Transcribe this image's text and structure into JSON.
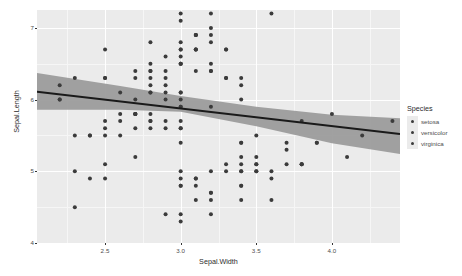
{
  "chart_data": {
    "type": "scatter",
    "title": "",
    "xlabel": "Sepal.Width",
    "ylabel": "Sepal.Length",
    "xlim": [
      2.05,
      4.45
    ],
    "ylim": [
      4.0,
      7.25
    ],
    "xticks": [
      2.5,
      3.0,
      3.5,
      4.0
    ],
    "xtick_labels": [
      "2.5",
      "3.0",
      "3.5",
      "4.0"
    ],
    "yticks": [
      4,
      5,
      6,
      7
    ],
    "ytick_labels": [
      "4",
      "5",
      "6",
      "7"
    ],
    "x_minor_ticks": [
      2.25,
      2.75,
      3.25,
      3.75,
      4.25
    ],
    "y_minor_ticks": [
      4.5,
      5.5,
      6.5
    ],
    "grid": true,
    "legend_position": "right",
    "point_color": "#3b3b3b",
    "panel_background": "#ebebeb",
    "gridline_color": "#ffffff",
    "smooth": {
      "method": "lm",
      "line_color": "#1a1a1a",
      "band_color": "#999999",
      "line": [
        {
          "x": 2.05,
          "y": 6.11
        },
        {
          "x": 4.45,
          "y": 5.52
        }
      ],
      "band_upper": [
        {
          "x": 2.05,
          "y": 6.37
        },
        {
          "x": 2.6,
          "y": 6.19
        },
        {
          "x": 3.0,
          "y": 6.05
        },
        {
          "x": 3.5,
          "y": 5.9
        },
        {
          "x": 4.0,
          "y": 5.79
        },
        {
          "x": 4.45,
          "y": 5.74
        }
      ],
      "band_lower": [
        {
          "x": 2.05,
          "y": 5.86
        },
        {
          "x": 2.6,
          "y": 5.86
        },
        {
          "x": 3.0,
          "y": 5.83
        },
        {
          "x": 3.5,
          "y": 5.63
        },
        {
          "x": 4.0,
          "y": 5.39
        },
        {
          "x": 4.45,
          "y": 5.24
        }
      ]
    },
    "legend": {
      "title": "Species",
      "entries": [
        {
          "label": "setosa",
          "color": "#3b3b3b"
        },
        {
          "label": "versicolor",
          "color": "#3b3b3b"
        },
        {
          "label": "virginica",
          "color": "#3b3b3b"
        }
      ]
    },
    "points": [
      {
        "x": 3.5,
        "y": 5.1
      },
      {
        "x": 3.0,
        "y": 4.9
      },
      {
        "x": 3.2,
        "y": 4.7
      },
      {
        "x": 3.1,
        "y": 4.6
      },
      {
        "x": 3.6,
        "y": 5.0
      },
      {
        "x": 3.9,
        "y": 5.4
      },
      {
        "x": 3.4,
        "y": 4.6
      },
      {
        "x": 3.4,
        "y": 5.0
      },
      {
        "x": 2.9,
        "y": 4.4
      },
      {
        "x": 3.1,
        "y": 4.9
      },
      {
        "x": 3.7,
        "y": 5.4
      },
      {
        "x": 3.4,
        "y": 4.8
      },
      {
        "x": 3.0,
        "y": 4.8
      },
      {
        "x": 3.0,
        "y": 4.3
      },
      {
        "x": 4.0,
        "y": 5.8
      },
      {
        "x": 4.4,
        "y": 5.7
      },
      {
        "x": 3.9,
        "y": 5.4
      },
      {
        "x": 3.5,
        "y": 5.1
      },
      {
        "x": 3.8,
        "y": 5.7
      },
      {
        "x": 3.8,
        "y": 5.1
      },
      {
        "x": 3.4,
        "y": 5.4
      },
      {
        "x": 3.7,
        "y": 5.1
      },
      {
        "x": 3.6,
        "y": 4.6
      },
      {
        "x": 3.3,
        "y": 5.1
      },
      {
        "x": 3.4,
        "y": 4.8
      },
      {
        "x": 3.0,
        "y": 5.0
      },
      {
        "x": 3.4,
        "y": 5.0
      },
      {
        "x": 3.5,
        "y": 5.2
      },
      {
        "x": 3.4,
        "y": 5.2
      },
      {
        "x": 3.2,
        "y": 4.7
      },
      {
        "x": 3.1,
        "y": 4.8
      },
      {
        "x": 3.4,
        "y": 5.4
      },
      {
        "x": 4.1,
        "y": 5.2
      },
      {
        "x": 4.2,
        "y": 5.5
      },
      {
        "x": 3.1,
        "y": 4.9
      },
      {
        "x": 3.2,
        "y": 5.0
      },
      {
        "x": 3.5,
        "y": 5.5
      },
      {
        "x": 3.6,
        "y": 4.9
      },
      {
        "x": 3.0,
        "y": 4.4
      },
      {
        "x": 3.4,
        "y": 5.1
      },
      {
        "x": 3.5,
        "y": 5.0
      },
      {
        "x": 2.3,
        "y": 4.5
      },
      {
        "x": 3.2,
        "y": 4.4
      },
      {
        "x": 3.5,
        "y": 5.0
      },
      {
        "x": 3.8,
        "y": 5.1
      },
      {
        "x": 3.0,
        "y": 4.8
      },
      {
        "x": 3.8,
        "y": 5.1
      },
      {
        "x": 3.2,
        "y": 4.6
      },
      {
        "x": 3.7,
        "y": 5.3
      },
      {
        "x": 3.3,
        "y": 5.0
      },
      {
        "x": 3.2,
        "y": 7.0
      },
      {
        "x": 3.2,
        "y": 6.4
      },
      {
        "x": 3.1,
        "y": 6.9
      },
      {
        "x": 2.3,
        "y": 5.5
      },
      {
        "x": 2.8,
        "y": 6.5
      },
      {
        "x": 2.8,
        "y": 5.7
      },
      {
        "x": 3.3,
        "y": 6.3
      },
      {
        "x": 2.4,
        "y": 4.9
      },
      {
        "x": 2.9,
        "y": 6.6
      },
      {
        "x": 2.7,
        "y": 5.2
      },
      {
        "x": 2.0,
        "y": 5.0
      },
      {
        "x": 3.0,
        "y": 5.9
      },
      {
        "x": 2.2,
        "y": 6.0
      },
      {
        "x": 2.9,
        "y": 6.1
      },
      {
        "x": 2.9,
        "y": 5.6
      },
      {
        "x": 3.1,
        "y": 6.7
      },
      {
        "x": 3.0,
        "y": 5.6
      },
      {
        "x": 2.7,
        "y": 5.8
      },
      {
        "x": 2.2,
        "y": 6.2
      },
      {
        "x": 2.5,
        "y": 5.6
      },
      {
        "x": 3.2,
        "y": 5.9
      },
      {
        "x": 2.8,
        "y": 6.1
      },
      {
        "x": 2.5,
        "y": 6.3
      },
      {
        "x": 2.8,
        "y": 6.1
      },
      {
        "x": 2.9,
        "y": 6.4
      },
      {
        "x": 3.0,
        "y": 6.6
      },
      {
        "x": 2.8,
        "y": 6.8
      },
      {
        "x": 3.0,
        "y": 6.7
      },
      {
        "x": 2.9,
        "y": 6.0
      },
      {
        "x": 2.6,
        "y": 5.7
      },
      {
        "x": 2.4,
        "y": 5.5
      },
      {
        "x": 2.4,
        "y": 5.5
      },
      {
        "x": 2.7,
        "y": 5.8
      },
      {
        "x": 2.7,
        "y": 6.0
      },
      {
        "x": 3.0,
        "y": 5.4
      },
      {
        "x": 3.4,
        "y": 6.0
      },
      {
        "x": 3.1,
        "y": 6.7
      },
      {
        "x": 2.3,
        "y": 6.3
      },
      {
        "x": 3.0,
        "y": 5.6
      },
      {
        "x": 2.5,
        "y": 5.5
      },
      {
        "x": 2.6,
        "y": 5.5
      },
      {
        "x": 3.0,
        "y": 6.1
      },
      {
        "x": 2.6,
        "y": 5.8
      },
      {
        "x": 2.3,
        "y": 5.0
      },
      {
        "x": 2.7,
        "y": 5.6
      },
      {
        "x": 3.0,
        "y": 5.7
      },
      {
        "x": 2.9,
        "y": 5.7
      },
      {
        "x": 2.9,
        "y": 6.2
      },
      {
        "x": 2.5,
        "y": 5.1
      },
      {
        "x": 2.8,
        "y": 5.7
      },
      {
        "x": 3.3,
        "y": 6.3
      },
      {
        "x": 2.7,
        "y": 5.8
      },
      {
        "x": 3.0,
        "y": 7.1
      },
      {
        "x": 2.9,
        "y": 6.3
      },
      {
        "x": 3.0,
        "y": 6.5
      },
      {
        "x": 3.0,
        "y": 7.6
      },
      {
        "x": 2.5,
        "y": 4.9
      },
      {
        "x": 2.9,
        "y": 7.3
      },
      {
        "x": 2.5,
        "y": 6.7
      },
      {
        "x": 3.6,
        "y": 7.2
      },
      {
        "x": 3.2,
        "y": 6.5
      },
      {
        "x": 2.7,
        "y": 6.4
      },
      {
        "x": 3.0,
        "y": 6.8
      },
      {
        "x": 2.5,
        "y": 5.7
      },
      {
        "x": 2.8,
        "y": 5.8
      },
      {
        "x": 3.2,
        "y": 6.4
      },
      {
        "x": 3.0,
        "y": 6.5
      },
      {
        "x": 3.8,
        "y": 7.7
      },
      {
        "x": 2.6,
        "y": 7.7
      },
      {
        "x": 2.2,
        "y": 6.0
      },
      {
        "x": 3.2,
        "y": 6.9
      },
      {
        "x": 2.8,
        "y": 5.6
      },
      {
        "x": 2.8,
        "y": 7.7
      },
      {
        "x": 2.7,
        "y": 6.3
      },
      {
        "x": 3.3,
        "y": 6.7
      },
      {
        "x": 3.2,
        "y": 7.2
      },
      {
        "x": 2.8,
        "y": 6.2
      },
      {
        "x": 3.0,
        "y": 6.1
      },
      {
        "x": 2.8,
        "y": 6.4
      },
      {
        "x": 3.0,
        "y": 7.2
      },
      {
        "x": 2.8,
        "y": 7.4
      },
      {
        "x": 3.8,
        "y": 7.9
      },
      {
        "x": 2.8,
        "y": 6.4
      },
      {
        "x": 2.8,
        "y": 6.3
      },
      {
        "x": 2.6,
        "y": 6.1
      },
      {
        "x": 3.0,
        "y": 7.7
      },
      {
        "x": 3.4,
        "y": 6.3
      },
      {
        "x": 3.1,
        "y": 6.4
      },
      {
        "x": 3.0,
        "y": 6.0
      },
      {
        "x": 3.1,
        "y": 6.9
      },
      {
        "x": 3.1,
        "y": 6.7
      },
      {
        "x": 3.1,
        "y": 6.9
      },
      {
        "x": 2.7,
        "y": 5.8
      },
      {
        "x": 3.2,
        "y": 6.8
      },
      {
        "x": 3.3,
        "y": 6.7
      },
      {
        "x": 3.0,
        "y": 6.7
      },
      {
        "x": 2.5,
        "y": 6.3
      },
      {
        "x": 3.0,
        "y": 6.5
      },
      {
        "x": 3.4,
        "y": 6.2
      },
      {
        "x": 3.0,
        "y": 5.9
      }
    ]
  }
}
